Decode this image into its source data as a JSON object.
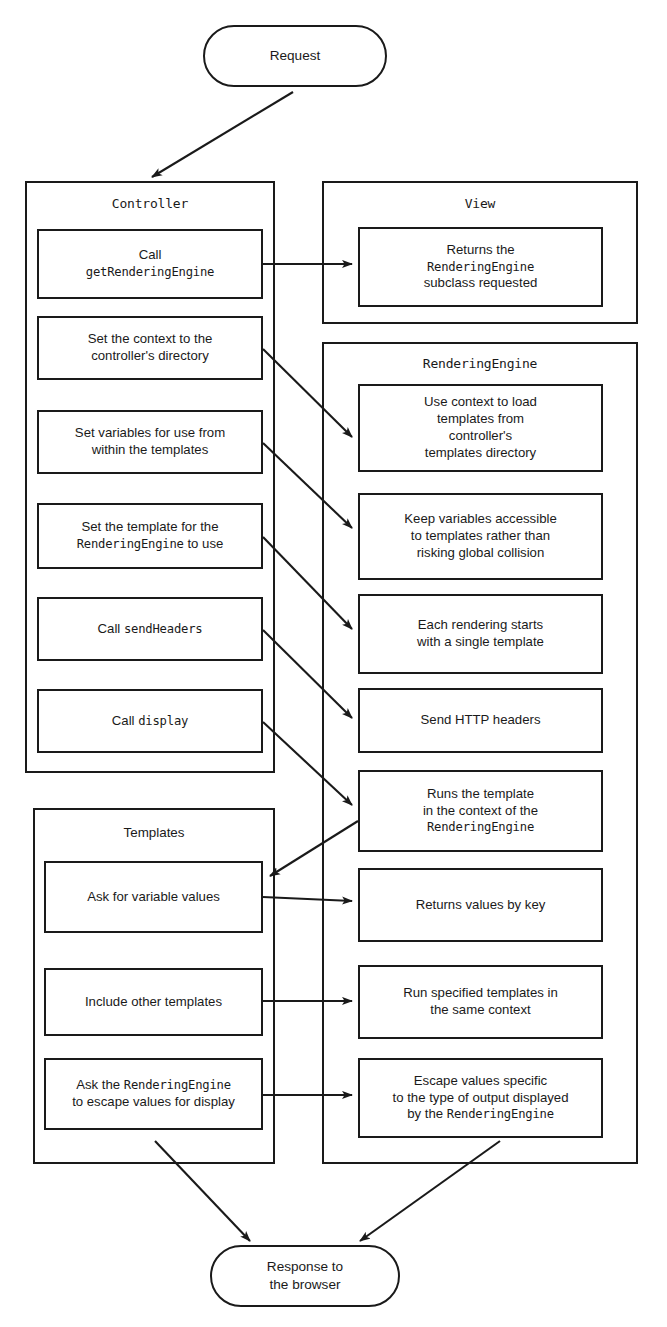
{
  "diagram": {
    "colors": {
      "stroke": "#1a1a1a",
      "fill": "#ffffff"
    },
    "start": {
      "label": "Request"
    },
    "end": {
      "label": "Response to\nthe browser"
    },
    "groups": [
      {
        "id": "controller",
        "title": "Controller",
        "title_style": "mono"
      },
      {
        "id": "view",
        "title": "View",
        "title_style": "mono"
      },
      {
        "id": "renderingengine",
        "title": "RenderingEngine",
        "title_style": "mono"
      },
      {
        "id": "templates",
        "title": "Templates",
        "title_style": "sans"
      }
    ],
    "controller_steps": [
      {
        "id": "c1",
        "lines": [
          {
            "t": "Call",
            "s": "sans"
          }
        ],
        "lines2": [
          {
            "t": "getRenderingEngine",
            "s": "mono"
          }
        ]
      },
      {
        "id": "c2",
        "lines": [
          {
            "t": "Set the context to the",
            "s": "sans"
          }
        ],
        "lines2": [
          {
            "t": "controller's directory",
            "s": "sans"
          }
        ]
      },
      {
        "id": "c3",
        "lines": [
          {
            "t": "Set variables for use from",
            "s": "sans"
          }
        ],
        "lines2": [
          {
            "t": "within the templates",
            "s": "sans"
          }
        ]
      },
      {
        "id": "c4",
        "lines": [
          {
            "t": "Set the template for the",
            "s": "sans"
          }
        ],
        "lines2": [
          {
            "t": "RenderingEngine",
            "s": "mono"
          },
          {
            "t": " to use",
            "s": "sans"
          }
        ]
      },
      {
        "id": "c5",
        "lines": [
          {
            "t": "Call ",
            "s": "sans"
          },
          {
            "t": "sendHeaders",
            "s": "mono"
          }
        ],
        "lines2": []
      },
      {
        "id": "c6",
        "lines": [
          {
            "t": "Call ",
            "s": "sans"
          },
          {
            "t": "display",
            "s": "mono"
          }
        ],
        "lines2": []
      }
    ],
    "view_steps": [
      {
        "id": "v1",
        "lines": [
          {
            "t": "Returns the",
            "s": "sans"
          }
        ],
        "lines2": [
          {
            "t": "RenderingEngine",
            "s": "mono"
          }
        ],
        "lines3": [
          {
            "t": "subclass requested",
            "s": "sans"
          }
        ]
      }
    ],
    "engine_steps": [
      {
        "id": "r1",
        "lines": [
          {
            "t": "Use context to load",
            "s": "sans"
          }
        ],
        "lines2": [
          {
            "t": "templates from",
            "s": "sans"
          }
        ],
        "lines3": [
          {
            "t": "controller's",
            "s": "sans"
          }
        ],
        "lines4": [
          {
            "t": "templates directory",
            "s": "sans"
          }
        ]
      },
      {
        "id": "r2",
        "lines": [
          {
            "t": "Keep variables accessible",
            "s": "sans"
          }
        ],
        "lines2": [
          {
            "t": "to templates rather than",
            "s": "sans"
          }
        ],
        "lines3": [
          {
            "t": "risking global collision",
            "s": "sans"
          }
        ]
      },
      {
        "id": "r3",
        "lines": [
          {
            "t": "Each rendering starts",
            "s": "sans"
          }
        ],
        "lines2": [
          {
            "t": "with a single template",
            "s": "sans"
          }
        ]
      },
      {
        "id": "r4",
        "lines": [
          {
            "t": "Send HTTP headers",
            "s": "sans"
          }
        ],
        "lines2": []
      },
      {
        "id": "r5",
        "lines": [
          {
            "t": "Runs the template",
            "s": "sans"
          }
        ],
        "lines2": [
          {
            "t": "in the context of the",
            "s": "sans"
          }
        ],
        "lines3": [
          {
            "t": "RenderingEngine",
            "s": "mono"
          }
        ]
      },
      {
        "id": "r6",
        "lines": [
          {
            "t": "Returns values by key",
            "s": "sans"
          }
        ],
        "lines2": []
      },
      {
        "id": "r7",
        "lines": [
          {
            "t": "Run specified templates in",
            "s": "sans"
          }
        ],
        "lines2": [
          {
            "t": "the same context",
            "s": "sans"
          }
        ]
      },
      {
        "id": "r8",
        "lines": [
          {
            "t": "Escape values specific",
            "s": "sans"
          }
        ],
        "lines2": [
          {
            "t": "to the type of output displayed",
            "s": "sans"
          }
        ],
        "lines3": [
          {
            "t": "by the ",
            "s": "sans"
          },
          {
            "t": "RenderingEngine",
            "s": "mono"
          }
        ]
      }
    ],
    "template_steps": [
      {
        "id": "t1",
        "lines": [
          {
            "t": "Ask for variable values",
            "s": "sans"
          }
        ],
        "lines2": []
      },
      {
        "id": "t2",
        "lines": [
          {
            "t": "Include other templates",
            "s": "sans"
          }
        ],
        "lines2": []
      },
      {
        "id": "t3",
        "lines": [
          {
            "t": "Ask the ",
            "s": "sans"
          },
          {
            "t": "RenderingEngine",
            "s": "mono"
          }
        ],
        "lines2": [
          {
            "t": "to escape values for display",
            "s": "sans"
          }
        ]
      }
    ],
    "edges": [
      {
        "from": "request",
        "to": "controller"
      },
      {
        "from": "c1",
        "to": "v1"
      },
      {
        "from": "c2",
        "to": "r1"
      },
      {
        "from": "c3",
        "to": "r2"
      },
      {
        "from": "c4",
        "to": "r3"
      },
      {
        "from": "c5",
        "to": "r4"
      },
      {
        "from": "c6",
        "to": "r5"
      },
      {
        "from": "r5",
        "to": "t1"
      },
      {
        "from": "t1",
        "to": "r6"
      },
      {
        "from": "t2",
        "to": "r7"
      },
      {
        "from": "t3",
        "to": "r8"
      },
      {
        "from": "templates",
        "to": "response"
      },
      {
        "from": "r8",
        "to": "response"
      }
    ]
  }
}
